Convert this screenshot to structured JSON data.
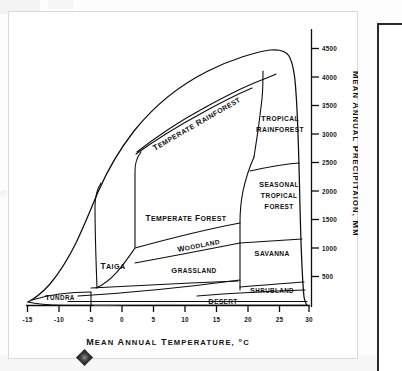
{
  "figure": {
    "x_axis": {
      "title": "Mean annual temperature,  °C",
      "ticks": [
        "-15",
        "-10",
        "-5",
        "0",
        "5",
        "10",
        "15",
        "20",
        "25",
        "30"
      ],
      "min": -15,
      "max": 30,
      "step": 5,
      "unit": "°C"
    },
    "y_axis": {
      "title": "Mean annual precipitaion, mm",
      "ticks": [
        "500",
        "1000",
        "1500",
        "2000",
        "2500",
        "3000",
        "3500",
        "4000",
        "4500"
      ],
      "min": 0,
      "max": 4700,
      "step": 500,
      "unit": "mm"
    },
    "colors": {
      "ink": "#0d0d0d",
      "paper": "#ffffff",
      "frame": "#d9d9d9",
      "panel_border": "#2a2a2a"
    }
  },
  "chart_data": {
    "type": "line",
    "xlabel": "Mean annual temperature,  °C",
    "ylabel": "Mean annual precipitaion, mm",
    "xlim": [
      -15,
      30
    ],
    "ylim": [
      0,
      4700
    ],
    "grid": false,
    "legend": "none",
    "x": [
      -15,
      -10,
      -5,
      0,
      5,
      10,
      15,
      20,
      25,
      30
    ],
    "xtick_labels": [
      "-15",
      "-10",
      "-5",
      "0",
      "5",
      "10",
      "15",
      "20",
      "25",
      "30"
    ],
    "ytick_values": [
      500,
      1000,
      1500,
      2000,
      2500,
      3000,
      3500,
      4000,
      4500
    ],
    "ytick_labels": [
      "500",
      "1000",
      "1500",
      "2000",
      "2500",
      "3000",
      "3500",
      "4000",
      "4500"
    ],
    "series": [
      {
        "name": "Upper climate envelope",
        "comment": "Maximum mean annual precipitation observed at each mean annual temperature",
        "points": [
          {
            "t": -15,
            "p": 100
          },
          {
            "t": -12,
            "p": 180
          },
          {
            "t": -9,
            "p": 280
          },
          {
            "t": -5,
            "p": 450
          },
          {
            "t": -3,
            "p": 900
          },
          {
            "t": 0,
            "p": 1450
          },
          {
            "t": 5,
            "p": 2100
          },
          {
            "t": 10,
            "p": 2700
          },
          {
            "t": 15,
            "p": 3200
          },
          {
            "t": 20,
            "p": 3750
          },
          {
            "t": 24,
            "p": 4350
          },
          {
            "t": 26,
            "p": 4450
          },
          {
            "t": 28,
            "p": 3600
          },
          {
            "t": 29,
            "p": 2000
          },
          {
            "t": 30,
            "p": 450
          }
        ]
      },
      {
        "name": "Lower climate envelope",
        "comment": "Baseline of the climate envelope, near zero precipitation",
        "points": [
          {
            "t": -15,
            "p": 60
          },
          {
            "t": -10,
            "p": 30
          },
          {
            "t": 0,
            "p": 20
          },
          {
            "t": 15,
            "p": 20
          },
          {
            "t": 30,
            "p": 20
          }
        ]
      }
    ],
    "biomes": [
      {
        "id": "tundra",
        "label": "Tundra",
        "orientation": "horizontal",
        "t_range": [
          -15,
          -5
        ],
        "p_range": [
          0,
          500
        ]
      },
      {
        "id": "taiga",
        "label": "Taiga",
        "orientation": "horizontal",
        "t_range": [
          -5,
          3
        ],
        "p_range": [
          150,
          1200
        ]
      },
      {
        "id": "temperate-forest",
        "label": "Temperate Forest",
        "orientation": "horizontal",
        "t_range": [
          3,
          19
        ],
        "p_range": [
          700,
          2300
        ]
      },
      {
        "id": "temperate-rainforest",
        "label": "Temperate Rainforest",
        "orientation": "rotated",
        "t_range": [
          2,
          20
        ],
        "p_range": [
          2000,
          3400
        ]
      },
      {
        "id": "tropical-rainforest",
        "label": "Tropical Rainforest",
        "orientation": "horizontal",
        "t_range": [
          20,
          30
        ],
        "p_range": [
          2500,
          4500
        ]
      },
      {
        "id": "seasonal-tropical-forest",
        "label": "Seasonal Tropical Forest",
        "orientation": "horizontal",
        "t_range": [
          19,
          30
        ],
        "p_range": [
          1200,
          2500
        ]
      },
      {
        "id": "woodland",
        "label": "Woodland",
        "orientation": "rotated",
        "t_range": [
          8,
          19
        ],
        "p_range": [
          500,
          1100
        ]
      },
      {
        "id": "grassland",
        "label": "Grassland",
        "orientation": "horizontal",
        "t_range": [
          3,
          19
        ],
        "p_range": [
          250,
          700
        ]
      },
      {
        "id": "savanna",
        "label": "Savanna",
        "orientation": "horizontal",
        "t_range": [
          19,
          30
        ],
        "p_range": [
          500,
          1200
        ]
      },
      {
        "id": "shrubland",
        "label": "Shrubland",
        "orientation": "horizontal",
        "t_range": [
          19,
          30
        ],
        "p_range": [
          200,
          500
        ]
      },
      {
        "id": "desert",
        "label": "Desert",
        "orientation": "horizontal",
        "t_range": [
          -2,
          30
        ],
        "p_range": [
          0,
          200
        ]
      }
    ]
  }
}
